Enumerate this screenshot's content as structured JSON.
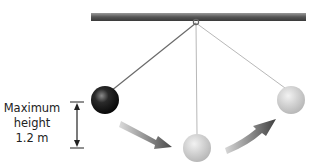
{
  "diagram": {
    "label": {
      "line1": "Maximum",
      "line2": "height",
      "line3": "1.2 m"
    },
    "elements": {
      "support_bar": "horizontal-support-bar",
      "pivot": "pivot-ring",
      "left_bob": "pendulum-bob-at-maximum-height",
      "middle_bob": "pendulum-bob-at-lowest-point",
      "right_bob": "pendulum-bob-at-opposite-maximum",
      "arrows": [
        "swing-down-arrow",
        "swing-up-arrow"
      ],
      "measure": "height-measurement-arrow"
    },
    "colors": {
      "bar": "#6e6e6e",
      "dark_bob": "#1a1a1a",
      "light_bob": "#c8c8c8",
      "string": "#9a9a9a",
      "arrow": "#555555"
    }
  }
}
